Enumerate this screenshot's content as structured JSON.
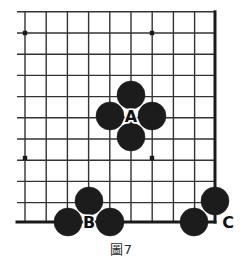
{
  "figure": {
    "caption": "圖7",
    "caption_label_cjk": "圖",
    "caption_number": "7"
  },
  "board": {
    "kind": "go-board-corner-diagram",
    "line_color": "#333333",
    "edge_color": "#1a1a1a",
    "stone_color": "#1c1c1c",
    "label_color": "#111111",
    "background": "#ffffff",
    "spacing": 21.2,
    "origin_x": 25,
    "origin_y": 11.8,
    "cols": 10,
    "rows": 11,
    "top_edge_visible": false,
    "left_edge_visible": false,
    "right_edge_x": 215,
    "bottom_edge_y": 222,
    "star_points": [
      {
        "x": 25,
        "y": 33
      },
      {
        "x": 152,
        "y": 33
      },
      {
        "x": 25,
        "y": 158
      },
      {
        "x": 152,
        "y": 158
      }
    ],
    "stones": [
      {
        "id": "a-north",
        "x": 131,
        "y": 95,
        "r": 14,
        "color": "black"
      },
      {
        "id": "a-west",
        "x": 110,
        "y": 116,
        "r": 14,
        "color": "black"
      },
      {
        "id": "a-east",
        "x": 152,
        "y": 116,
        "r": 14,
        "color": "black"
      },
      {
        "id": "a-south",
        "x": 131,
        "y": 137,
        "r": 14,
        "color": "black"
      },
      {
        "id": "b-upper",
        "x": 89,
        "y": 201,
        "r": 14,
        "color": "black"
      },
      {
        "id": "b-left",
        "x": 68,
        "y": 222,
        "r": 14,
        "color": "black"
      },
      {
        "id": "b-right",
        "x": 110,
        "y": 222,
        "r": 14,
        "color": "black"
      },
      {
        "id": "c-upper",
        "x": 215,
        "y": 201,
        "r": 14,
        "color": "black"
      },
      {
        "id": "c-left",
        "x": 194,
        "y": 222,
        "r": 14,
        "color": "black"
      }
    ],
    "labels": [
      {
        "id": "label-a",
        "text": "A",
        "x": 131,
        "y": 116
      },
      {
        "id": "label-b",
        "text": "B",
        "x": 89,
        "y": 222
      },
      {
        "id": "label-c",
        "text": "C",
        "x": 228,
        "y": 222
      }
    ]
  },
  "chart_data": {
    "type": "diagram",
    "title": "圖7",
    "subtitle": "",
    "grid": {
      "columns": 10,
      "rows": 11,
      "spacing_px": 21.2,
      "show_grid": true
    },
    "groups": [
      {
        "name": "A",
        "stones": 4,
        "shape": "diamond-around-empty-point",
        "color": "black"
      },
      {
        "name": "B",
        "stones": 3,
        "shape": "bent-three-on-edge",
        "color": "black"
      },
      {
        "name": "C",
        "stones": 2,
        "shape": "corner-pair",
        "color": "black"
      }
    ]
  }
}
